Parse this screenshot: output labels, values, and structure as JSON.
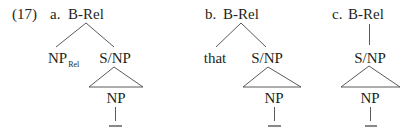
{
  "example_number": "(17)",
  "trees": [
    {
      "letter": "a.",
      "root": "B-Rel",
      "left_child": {
        "label": "NP",
        "subscript": "Rel"
      },
      "right_child": "S/NP",
      "gap_node": "NP",
      "gap_trace": "—"
    },
    {
      "letter": "b.",
      "root": "B-Rel",
      "left_child": {
        "label": "that"
      },
      "right_child": "S/NP",
      "gap_node": "NP",
      "gap_trace": "—"
    },
    {
      "letter": "c.",
      "root": "B-Rel",
      "child": "S/NP",
      "gap_node": "NP",
      "gap_trace": "—"
    }
  ]
}
